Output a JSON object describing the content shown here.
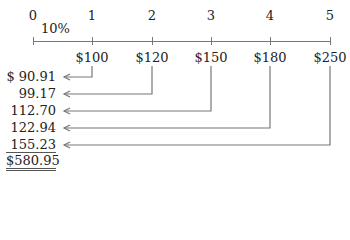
{
  "timeline": {
    "periods": [
      "0",
      "1",
      "2",
      "3",
      "4",
      "5"
    ],
    "rate": "10%",
    "cash_flows": [
      "$100",
      "$120",
      "$150",
      "$180",
      "$250"
    ]
  },
  "present_values": [
    "$ 90.91",
    "99.17",
    "112.70",
    "122.94",
    "155.23"
  ],
  "total": "$580.95",
  "colors": {
    "line": "#777777",
    "text": "#222222"
  }
}
